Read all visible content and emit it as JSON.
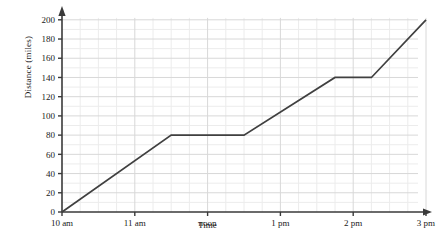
{
  "chart_data": {
    "type": "line",
    "title": "",
    "subtitle": "",
    "xlabel": "Time",
    "ylabel": "Distance (miles)",
    "grid": true,
    "legend": false,
    "legend_position": "none",
    "line_color": "#404040",
    "grid_major_color": "#d8d8d8",
    "grid_minor_color": "#ececec",
    "axis_color": "#3a3a3a",
    "background": "#ffffff",
    "xlim": [
      0,
      5
    ],
    "ylim": [
      0,
      205
    ],
    "x_axis_unit": "hours after 10am",
    "x_tick_labels": [
      "10 am",
      "11 am",
      "noon",
      "1 pm",
      "2 pm",
      "3 pm"
    ],
    "x_tick_values": [
      0,
      1,
      2,
      3,
      4,
      5
    ],
    "x_minor_interval": 0.25,
    "y_tick_labels": [
      "0",
      "20",
      "40",
      "60",
      "80",
      "100",
      "120",
      "140",
      "160",
      "180",
      "200"
    ],
    "y_tick_values": [
      0,
      20,
      40,
      60,
      80,
      100,
      120,
      140,
      160,
      180,
      200
    ],
    "y_minor_interval": 10,
    "series": [
      {
        "name": "distance travelled",
        "x": [
          0,
          1.5,
          2.5,
          3.75,
          4.25,
          5
        ],
        "y": [
          0,
          80,
          80,
          140,
          140,
          200
        ],
        "x_labels": [
          "10 am",
          "11:30 am",
          "12:30 pm",
          "1:45 pm",
          "2:15 pm",
          "3 pm"
        ],
        "values": [
          0,
          80,
          80,
          140,
          140,
          200
        ]
      }
    ],
    "annotations": []
  },
  "axes": {
    "y_label": "Distance (miles)",
    "x_label": "Time"
  }
}
